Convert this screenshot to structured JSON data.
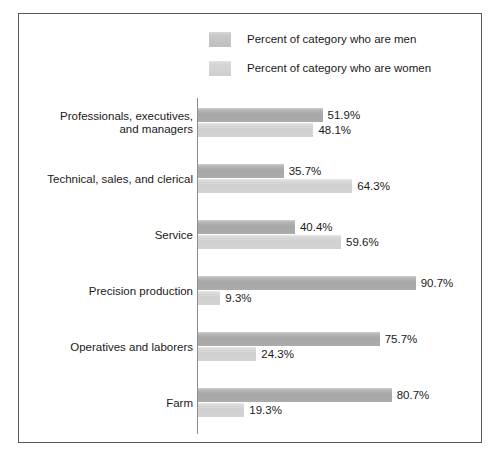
{
  "legend": {
    "items": [
      {
        "label": "Percent of category who are men",
        "series": "men",
        "color": "#b6b6b6"
      },
      {
        "label": "Percent of category who are women",
        "series": "women",
        "color": "#d9d9d9"
      }
    ]
  },
  "chart_data": {
    "type": "bar",
    "orientation": "horizontal",
    "title": "",
    "xlabel": "",
    "ylabel": "",
    "xlim": [
      0,
      100
    ],
    "grid": false,
    "legend_position": "top",
    "value_suffix": "%",
    "categories": [
      "Professionals, executives, and managers",
      "Technical, sales, and clerical",
      "Service",
      "Precision production",
      "Operatives and laborers",
      "Farm"
    ],
    "category_lines": [
      [
        "Professionals, executives,",
        "and managers"
      ],
      [
        "Technical, sales, and clerical"
      ],
      [
        "Service"
      ],
      [
        "Precision production"
      ],
      [
        "Operatives and laborers"
      ],
      [
        "Farm"
      ]
    ],
    "series": [
      {
        "name": "Percent of category who are men",
        "key": "men",
        "values": [
          51.9,
          35.7,
          40.4,
          90.7,
          75.7,
          80.7
        ],
        "labels": [
          "51.9%",
          "35.7%",
          "40.4%",
          "90.7%",
          "75.7%",
          "80.7%"
        ]
      },
      {
        "name": "Percent of category who are women",
        "key": "women",
        "values": [
          48.1,
          64.3,
          59.6,
          9.3,
          24.3,
          19.3
        ],
        "labels": [
          "48.1%",
          "64.3%",
          "59.6%",
          "9.3%",
          "24.3%",
          "19.3%"
        ]
      }
    ]
  }
}
